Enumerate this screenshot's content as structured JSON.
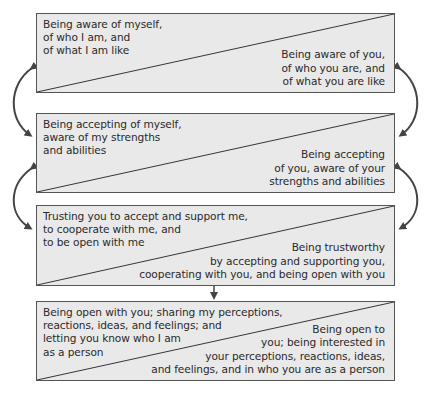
{
  "diagram": {
    "type": "flow",
    "boxes": [
      {
        "self": "Being aware of myself,\nof who I am, and\nof what I am like",
        "other": "Being aware of you,\nof who you are, and\nof what you are like"
      },
      {
        "self": "Being accepting of myself,\naware of my strengths\nand abilities",
        "other": "Being accepting\nof you, aware of your\nstrengths and abilities"
      },
      {
        "self": "Trusting you to accept and support me,\nto cooperate with me, and\nto be open with me",
        "other": "Being trustworthy\nby accepting and supporting you,\ncooperating with you, and being open with you"
      },
      {
        "self": "Being open with you; sharing my perceptions,\nreactions, ideas, and feelings; and\nletting you know who I am\nas a person",
        "other": "Being open to\nyou; being interested in\nyour perceptions, reactions, ideas,\nand feelings, and in who you are as a person"
      }
    ],
    "connectors": [
      {
        "from": 0,
        "to": 1,
        "type": "bidirectional-curved",
        "sides": [
          "left",
          "right"
        ]
      },
      {
        "from": 1,
        "to": 2,
        "type": "bidirectional-curved",
        "sides": [
          "left",
          "right"
        ]
      },
      {
        "from": 2,
        "to": 3,
        "type": "down-arrow",
        "sides": [
          "center"
        ]
      }
    ],
    "colors": {
      "box_fill": "#e9e9e9",
      "border": "#555555",
      "arrow": "#444444",
      "text": "#2a2a2a"
    }
  }
}
